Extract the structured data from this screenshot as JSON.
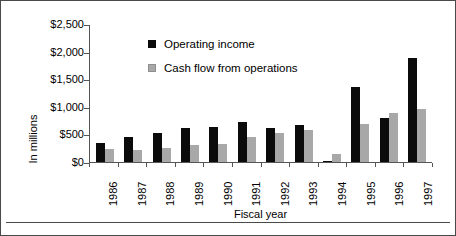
{
  "chart_data": {
    "type": "bar",
    "title": "",
    "xlabel": "Fiscal year",
    "ylabel": "In millions",
    "categories": [
      "1986",
      "1987",
      "1988",
      "1989",
      "1990",
      "1991",
      "1992",
      "1993",
      "1994",
      "1995",
      "1996",
      "1997"
    ],
    "series": [
      {
        "name": "Operating income",
        "color": "#0b0b0b",
        "values": [
          340,
          450,
          520,
          620,
          630,
          720,
          610,
          670,
          20,
          1350,
          790,
          1880
        ]
      },
      {
        "name": "Cash flow from operations",
        "color": "#a8a8a8",
        "values": [
          230,
          210,
          250,
          310,
          330,
          460,
          520,
          580,
          150,
          690,
          880,
          960
        ]
      }
    ],
    "ylim": [
      0,
      2500
    ],
    "ytick_values": [
      0,
      500,
      1000,
      1500,
      2000,
      2500
    ],
    "ytick_labels": [
      "$0",
      "$500",
      "$1,000",
      "$1,500",
      "$2,000",
      "$2,500"
    ],
    "grid": false,
    "legend_position": "inside-upper-left"
  },
  "axis": {
    "y_title": "In millions",
    "x_title": "Fiscal year"
  },
  "legend": {
    "entries": [
      {
        "label": "Operating income",
        "swatch": "black-square-swatch"
      },
      {
        "label": "Cash flow from operations",
        "swatch": "gray-square-swatch"
      }
    ]
  }
}
